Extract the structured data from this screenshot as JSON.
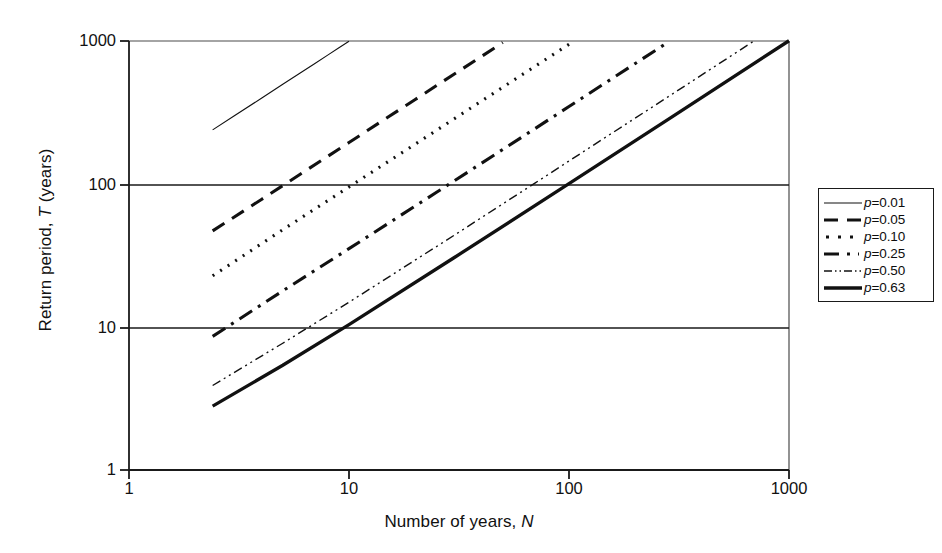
{
  "chart_data": {
    "type": "line",
    "title": "",
    "subtitle": "",
    "xlabel": "Number of years, N",
    "xlabel_plain": "Number of years,",
    "xlabel_italic": "N",
    "ylabel": "Return period, T (years)",
    "ylabel_plain_pre": "Return period,",
    "ylabel_italic": "T",
    "ylabel_plain_post": "(years)",
    "xscale": "log",
    "yscale": "log",
    "xlim": [
      1,
      1000
    ],
    "ylim": [
      1,
      1000
    ],
    "xticks": [
      "1",
      "10",
      "100",
      "1000"
    ],
    "xtick_values": [
      1,
      10,
      100,
      1000
    ],
    "yticks": [
      "1000",
      "100",
      "10",
      "1"
    ],
    "ytick_values": [
      1000,
      100,
      10,
      1
    ],
    "grid": "horizontal gridlines at T = 10 and T = 100",
    "legend_position": "right, outside axes",
    "formula": "T = 1 / (1 - (1 - p)^(1/N))",
    "series": [
      {
        "name": "p = 0.01",
        "label_var": "p",
        "label_eq": "=",
        "label_value": "0.01",
        "p": 0.01,
        "style": "solid-thin",
        "linewidth": 1.1,
        "dash": "none",
        "color": "#111111",
        "points_N": [
          2.4,
          3,
          4,
          5,
          6,
          7,
          8,
          9,
          10
        ],
        "points_T": [
          239,
          299,
          398,
          498,
          598,
          697,
          797,
          896,
          996
        ]
      },
      {
        "name": "p = 0.05",
        "label_var": "p",
        "label_eq": "=",
        "label_value": "0.05",
        "p": 0.05,
        "style": "long-dash",
        "linewidth": 3.1,
        "dash": "14,9",
        "color": "#111111",
        "points_N": [
          2.4,
          4,
          6,
          8,
          10,
          15,
          20,
          25,
          30,
          40,
          50
        ],
        "points_T": [
          47,
          78,
          117,
          156,
          195,
          293,
          390,
          488,
          585,
          780,
          975
        ]
      },
      {
        "name": "p = 0.10",
        "label_var": "p",
        "label_eq": "=",
        "label_value": "0.10",
        "p": 0.1,
        "style": "dotted",
        "linewidth": 3.1,
        "dash": "2,7",
        "color": "#111111",
        "points_N": [
          2.4,
          5,
          10,
          20,
          30,
          50,
          70,
          90,
          100
        ],
        "points_T": [
          22.8,
          47.9,
          95.4,
          190,
          285,
          475,
          664,
          854,
          949
        ]
      },
      {
        "name": "p = 0.25",
        "label_var": "p",
        "label_eq": "=",
        "label_value": "0.25",
        "p": 0.25,
        "style": "dash-dot",
        "linewidth": 3.1,
        "dash": "15,7,3,7",
        "color": "#111111",
        "points_N": [
          2.4,
          5,
          10,
          25,
          50,
          100,
          200,
          280
        ],
        "points_T": [
          8.6,
          17.9,
          35.3,
          87.5,
          174.3,
          348,
          696,
          974
        ]
      },
      {
        "name": "p = 0.50",
        "label_var": "p",
        "label_eq": "=",
        "label_value": "0.50",
        "p": 0.5,
        "style": "dash-dot-dot",
        "linewidth": 1.4,
        "dash": "9,4,2,4,2,4",
        "color": "#111111",
        "points_N": [
          2.4,
          5,
          10,
          30,
          70,
          100,
          300,
          693
        ],
        "points_T": [
          3.9,
          7.7,
          14.9,
          43.7,
          101.4,
          144.8,
          433,
          1000
        ]
      },
      {
        "name": "p = 0.63",
        "label_var": "p",
        "label_eq": "=",
        "label_value": "0.63",
        "p": 0.63,
        "style": "solid-thick",
        "linewidth": 3.3,
        "dash": "none",
        "color": "#111111",
        "points_N": [
          2.4,
          5,
          10,
          30,
          100,
          300,
          1000
        ],
        "points_T": [
          2.8,
          5.4,
          10.4,
          30.5,
          100.5,
          301,
          1004
        ]
      }
    ]
  },
  "axes": {
    "x_tick_labels": [
      "1",
      "10",
      "100",
      "1000"
    ],
    "y_tick_labels": [
      "1000",
      "100",
      "10",
      "1"
    ]
  },
  "legend": {
    "entries": [
      {
        "var": "p",
        "eq": "=",
        "value": "0.01"
      },
      {
        "var": "p",
        "eq": "=",
        "value": "0.05"
      },
      {
        "var": "p",
        "eq": "=",
        "value": "0.10"
      },
      {
        "var": "p",
        "eq": "=",
        "value": "0.25"
      },
      {
        "var": "p",
        "eq": "=",
        "value": "0.50"
      },
      {
        "var": "p",
        "eq": "=",
        "value": "0.63"
      }
    ]
  }
}
